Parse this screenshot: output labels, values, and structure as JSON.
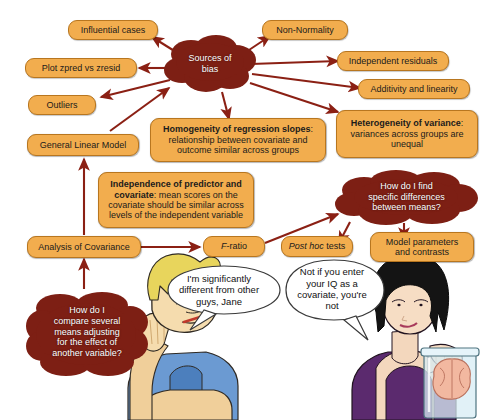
{
  "diagram": {
    "colors": {
      "node_fill": "#f2ad4e",
      "node_border": "#b8761f",
      "cloud_fill": "#7d1f14",
      "arrow": "#8b2014",
      "balloon_fill": "#ffffff",
      "balloon_border": "#3a3a3a",
      "text_dark": "#1b1b1b",
      "text_light": "#ffffff"
    },
    "clouds": [
      {
        "id": "sources-of-bias",
        "lines": [
          "Sources of",
          "bias"
        ]
      },
      {
        "id": "specific-differences",
        "lines": [
          "How do I find",
          "specific differences",
          "between means?"
        ]
      },
      {
        "id": "compare-means",
        "lines": [
          "How do I",
          "compare several",
          "means adjusting",
          "for the effect of",
          "another variable?"
        ]
      }
    ],
    "nodes": [
      {
        "id": "influential-cases",
        "label": "Influential cases"
      },
      {
        "id": "plot-zpred-zresid",
        "label": "Plot zpred vs zresid"
      },
      {
        "id": "outliers",
        "label": "Outliers"
      },
      {
        "id": "general-linear-model",
        "label": "General Linear Model"
      },
      {
        "id": "non-normality",
        "label": "Non-Normality"
      },
      {
        "id": "independent-residuals",
        "label": "Independent residuals"
      },
      {
        "id": "additivity-linearity",
        "label": "Additivity and linearity"
      },
      {
        "id": "analysis-of-covariance",
        "label": "Analysis of Covariance"
      },
      {
        "id": "f-ratio",
        "label": "F-ratio",
        "italic_part": "F"
      },
      {
        "id": "post-hoc-tests",
        "label": "Post hoc tests",
        "italic_part": "Post hoc"
      },
      {
        "id": "model-parameters",
        "lines": [
          "Model parameters",
          "and contrasts"
        ]
      },
      {
        "id": "heterogeneity-of-variance",
        "bold": "Heterogeneity of variance",
        "rest": ": variances across groups are unequal"
      },
      {
        "id": "homogeneity-of-regression-slopes",
        "bold": "Homogeneity of regression slopes",
        "rest": ": relationship between covariate and outcome similar across groups"
      },
      {
        "id": "independence-of-predictor-and-covariate",
        "bold": "Independence of predictor and covariate",
        "rest": ": mean scores on the covariate should be similar across levels of the independent variable"
      }
    ],
    "node_text": {
      "influential_cases": "Influential cases",
      "plot_zpred_vs_zresid": "Plot zpred vs zresid",
      "outliers": "Outliers",
      "general_linear_model": "General Linear Model",
      "non_normality": "Non-Normality",
      "independent_residuals": "Independent residuals",
      "additivity_and_linearity": "Additivity and linearity",
      "analysis_of_covariance": "Analysis of Covariance",
      "f_ratio_italic": "F",
      "f_ratio_rest": "-ratio",
      "post_hoc_italic": "Post hoc",
      "post_hoc_rest": " tests",
      "model_parameters_line1": "Model parameters",
      "model_parameters_line2": "and contrasts",
      "heterogeneity_bold": "Heterogeneity of variance",
      "heterogeneity_rest": ": variances across groups are unequal",
      "homogeneity_bold": "Homogeneity of regression slopes",
      "homogeneity_rest": ": relationship between covariate and outcome similar across groups",
      "independence_bold": "Independence of predictor and covariate",
      "independence_rest": ": mean scores on the covariate should be similar across levels of the independent variable"
    },
    "cloud_text": {
      "sources_of_bias_l1": "Sources of",
      "sources_of_bias_l2": "bias",
      "specific_diff_l1": "How do I find",
      "specific_diff_l2": "specific differences",
      "specific_diff_l3": "between means?",
      "compare_l1": "How do I",
      "compare_l2": "compare several",
      "compare_l3": "means adjusting",
      "compare_l4": "for the effect of",
      "compare_l5": "another variable?"
    },
    "balloons": [
      {
        "id": "balloon-male",
        "lines": [
          "I'm significantly",
          "different from other",
          "guys, Jane"
        ]
      },
      {
        "id": "balloon-female",
        "lines": [
          "Not if you enter",
          "your IQ as a",
          "covariate, you're",
          "not"
        ]
      }
    ],
    "balloon_text": {
      "male_l1": "I'm significantly",
      "male_l2": "different from other",
      "male_l3": "guys, Jane",
      "female_l1": "Not if you enter",
      "female_l2": "your IQ as a",
      "female_l3": "covariate, you're",
      "female_l4": "not"
    },
    "characters": [
      {
        "id": "male-character",
        "description": "blond man resting head on hand with pencil in mouth"
      },
      {
        "id": "female-character",
        "description": "dark haired woman holding a jar containing a brain"
      }
    ]
  }
}
